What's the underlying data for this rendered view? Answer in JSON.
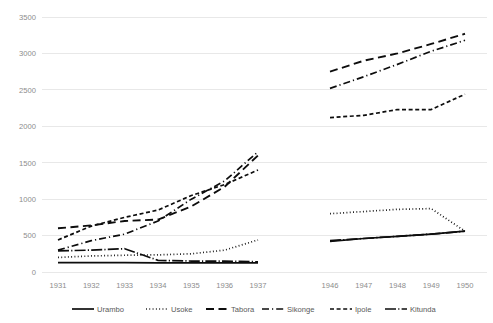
{
  "chart_data": {
    "type": "line",
    "title": "",
    "xlabel": "",
    "ylabel": "",
    "ylim": [
      0,
      3500
    ],
    "ytick_step": 500,
    "yticks": [
      "0",
      "500",
      "1000",
      "1500",
      "2000",
      "2500",
      "3000",
      "3500"
    ],
    "grid": true,
    "legend_position": "bottom",
    "axis_color": "#8c8c8c",
    "grid_color": "#e8e8e8",
    "line_color": "#0d0d0d",
    "categories": [
      "1931",
      "1932",
      "1933",
      "1934",
      "1935",
      "1936",
      "1937",
      "1946",
      "1947",
      "1948",
      "1949",
      "1950"
    ],
    "break_after": "1937",
    "series": [
      {
        "name": "Urambo",
        "style": "solid",
        "values": [
          130,
          130,
          130,
          125,
          125,
          125,
          125,
          420,
          460,
          490,
          520,
          560
        ]
      },
      {
        "name": "Usoke",
        "style": "dotted",
        "values": [
          200,
          220,
          230,
          235,
          250,
          300,
          440,
          800,
          830,
          860,
          870,
          560
        ]
      },
      {
        "name": "Tabora",
        "style": "dashed-long",
        "values": [
          600,
          640,
          700,
          720,
          900,
          1170,
          1600,
          2750,
          2900,
          3000,
          3130,
          3270
        ]
      },
      {
        "name": "Sikonge",
        "style": "dash-dot",
        "values": [
          300,
          430,
          520,
          700,
          1000,
          1250,
          1650,
          2520,
          2680,
          2850,
          3030,
          3180
        ]
      },
      {
        "name": "Ipole",
        "style": "dashed-short",
        "values": [
          440,
          630,
          750,
          850,
          1050,
          1200,
          1400,
          2120,
          2150,
          2230,
          2230,
          2440
        ]
      },
      {
        "name": "Kitunda",
        "style": "solid-dot",
        "values": [
          290,
          300,
          320,
          160,
          150,
          150,
          140,
          430,
          460,
          490,
          520,
          560
        ]
      }
    ]
  },
  "legend": {
    "entries": [
      {
        "label": "Urambo",
        "style": "solid"
      },
      {
        "label": "Usoke",
        "style": "dotted"
      },
      {
        "label": "Tabora",
        "style": "dashed-long"
      },
      {
        "label": "Sikonge",
        "style": "dash-dot"
      },
      {
        "label": "Ipole",
        "style": "dashed-short"
      },
      {
        "label": "Kitunda",
        "style": "solid-dot"
      }
    ]
  }
}
